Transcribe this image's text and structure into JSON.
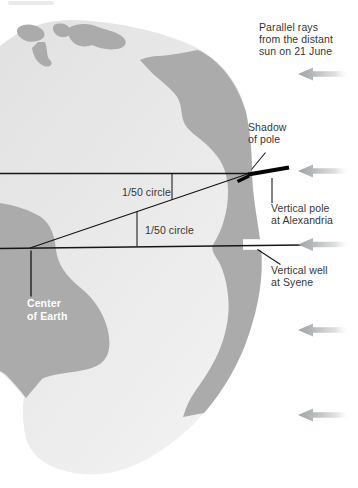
{
  "diagram": {
    "annotations": {
      "parallel_rays": "Parallel rays\nfrom the distant\nsun on 21 June",
      "shadow_of_pole": "Shadow\nof pole",
      "vertical_pole": "Vertical pole\nat Alexandria",
      "vertical_well": "Vertical well\nat Syene",
      "center_of_earth": "Center\nof Earth",
      "angle_upper": "1/50 circle",
      "angle_lower": "1/50 circle"
    },
    "icons": {
      "sun_ray_arrow": "left-pointing gray arrow",
      "sun_ray_arrow_count": 5
    },
    "colors": {
      "background": "#ffffff",
      "ocean": "#e6e6e6",
      "land": "#ababab",
      "line": "#161616",
      "pole": "#050505",
      "arrow_dark": "#a0a4a6",
      "label_text": "#363636",
      "center_label_text": "#ffffff",
      "well": "#ffffff"
    }
  }
}
